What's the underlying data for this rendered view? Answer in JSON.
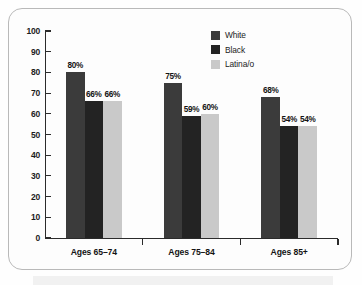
{
  "chart_data": {
    "type": "bar",
    "title": "",
    "xlabel": "",
    "ylabel": "",
    "ylim": [
      0,
      100
    ],
    "yticks": [
      0,
      10,
      20,
      30,
      40,
      50,
      60,
      70,
      80,
      90,
      100
    ],
    "grid": false,
    "legend_position": "top-right",
    "categories": [
      "Ages 65–74",
      "Ages 75–84",
      "Ages 85+"
    ],
    "series": [
      {
        "name": "White",
        "color": "#3b3b3b",
        "values": [
          80,
          75,
          68
        ],
        "labels": [
          "80%",
          "75%",
          "68%"
        ]
      },
      {
        "name": "Black",
        "color": "#232323",
        "values": [
          66,
          59,
          54
        ],
        "labels": [
          "66%",
          "59%",
          "54%"
        ]
      },
      {
        "name": "Latina/o",
        "color": "#c9c9c9",
        "values": [
          66,
          60,
          54
        ],
        "labels": [
          "66%",
          "60%",
          "54%"
        ]
      }
    ]
  },
  "axis": {
    "y_tick_labels": [
      "100",
      "90",
      "80",
      "70",
      "60",
      "50",
      "40",
      "30",
      "20",
      "10",
      "0"
    ]
  },
  "legend": {
    "items": [
      {
        "label": "White",
        "color": "#3b3b3b"
      },
      {
        "label": "Black",
        "color": "#232323"
      },
      {
        "label": "Latina/o",
        "color": "#c9c9c9"
      }
    ]
  }
}
